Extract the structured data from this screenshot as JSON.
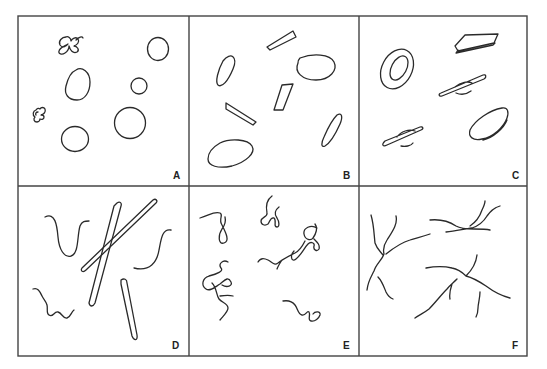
{
  "figure": {
    "layout": {
      "rows": 2,
      "columns": 3
    },
    "panels": [
      {
        "label": "A",
        "description": "rounded closed circles/ovals of varying sizes with two small tangled clusters"
      },
      {
        "label": "B",
        "description": "elongated ovals and thin flat rectangular/trapezoidal plates"
      },
      {
        "label": "C",
        "description": "3D-rendered flattened discs: a ring/donut, tablet plates and saucer shapes"
      },
      {
        "label": "D",
        "description": "long rods (thick and thin), curved threads and a wavy/zigzag filament"
      },
      {
        "label": "E",
        "description": "curly, looping, coiled thread fragments"
      },
      {
        "label": "F",
        "description": "branched, forked fiber networks"
      }
    ]
  }
}
